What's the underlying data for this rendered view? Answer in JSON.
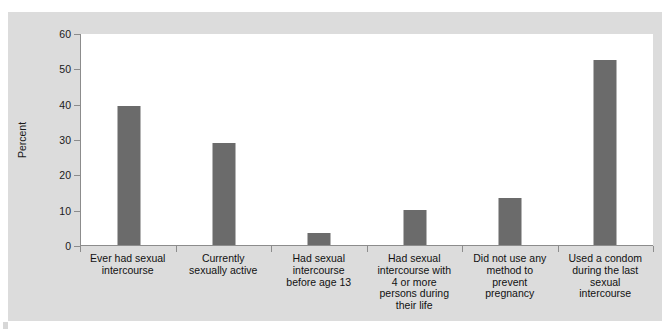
{
  "chart_data": {
    "type": "bar",
    "title": "",
    "subtitle": "",
    "xlabel": "",
    "ylabel": "Percent",
    "ylim": [
      0,
      60
    ],
    "yticks": [
      0,
      10,
      20,
      30,
      40,
      50,
      60
    ],
    "ytick_labels": [
      "0",
      "10",
      "20",
      "30",
      "40",
      "50",
      "60"
    ],
    "grid": false,
    "legend": "none",
    "bar_color": "#6b6b6b",
    "plot_background": "#ffffff",
    "figure_background": "#dcdcdc",
    "axis_color": "#8c8c8c",
    "categories": [
      "Ever had sexual\nintercourse",
      "Currently\nsexually active",
      "Had sexual\nintercourse\nbefore age 13",
      "Had sexual\nintercourse with\n4 or more\npersons during\ntheir life",
      "Did not use any\nmethod to\nprevent\npregnancy",
      "Used a condom\nduring the last\nsexual\nintercourse"
    ],
    "values": [
      39.4,
      28.9,
      3.4,
      9.8,
      13.3,
      52.4
    ]
  }
}
